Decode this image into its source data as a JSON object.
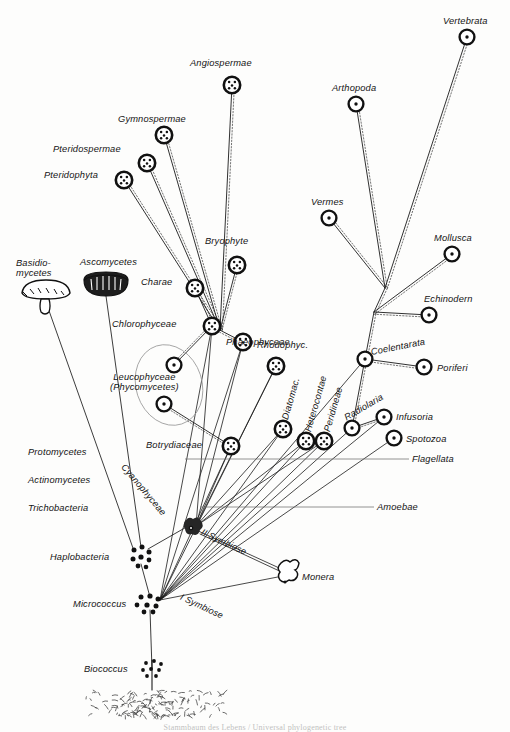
{
  "figure": {
    "caption": "Stammbaum des Lebens / Universal phylogenetic tree",
    "width": 510,
    "height": 732,
    "background_color": "#fdfdfc",
    "ink_color": "#141414"
  },
  "chart_data": {
    "type": "diagram",
    "subtype": "phylogenetic-tree",
    "root": "Biococcus",
    "grid": false,
    "legend": null,
    "xlabel": "",
    "ylabel": "",
    "nodes": [
      {
        "id": "biococcus",
        "label": "Biococcus",
        "x": 152,
        "y": 669,
        "marker": "dot-cluster",
        "label_dx": -62,
        "label_dy": -4
      },
      {
        "id": "micrococcus",
        "label": "Micrococcus",
        "x": 150,
        "y": 604,
        "marker": "dot-cluster",
        "label_dx": -73,
        "label_dy": -3
      },
      {
        "id": "haplobacteria",
        "label": "Haplobacteria",
        "x": 141,
        "y": 557,
        "marker": "dot-cluster",
        "label_dx": -84,
        "label_dy": -3
      },
      {
        "id": "symbiose1",
        "label": "I Symbiose",
        "x": 160,
        "y": 600,
        "marker": "none",
        "label_dx": 0,
        "label_dy": 0
      },
      {
        "id": "symbiose2",
        "label": "II Symbiose",
        "x": 193,
        "y": 528,
        "marker": "dot-small",
        "label_dx": 0,
        "label_dy": 0
      },
      {
        "id": "monera",
        "label": "Monera",
        "x": 288,
        "y": 575,
        "marker": "amoeba",
        "label_dx": 14,
        "label_dy": -4
      },
      {
        "id": "cyanophyceae",
        "label": "Cyanophyceae",
        "x": 193,
        "y": 528,
        "marker": "none",
        "label_dx": 0,
        "label_dy": 0
      },
      {
        "id": "basidiomycetes",
        "label": "Basidio-\nmycetes",
        "x": 46,
        "y": 289,
        "marker": "mushroom",
        "label_dx": -28,
        "label_dy": -34
      },
      {
        "id": "ascomycetes",
        "label": "Ascomycetes",
        "x": 106,
        "y": 284,
        "marker": "cup",
        "label_dx": -22,
        "label_dy": -31
      },
      {
        "id": "protomycetes",
        "label": "Protomycetes",
        "x": 62,
        "y": 452,
        "marker": "none",
        "label_dx": 0,
        "label_dy": 0
      },
      {
        "id": "actinomycetes",
        "label": "Actinomycetes",
        "x": 60,
        "y": 480,
        "marker": "none",
        "label_dx": 0,
        "label_dy": 0
      },
      {
        "id": "trichobacteria",
        "label": "Trichobacteria",
        "x": 62,
        "y": 508,
        "marker": "none",
        "label_dx": 0,
        "label_dy": 0
      },
      {
        "id": "chlorophyceae",
        "label": "Chlorophyceae",
        "x": 212,
        "y": 326,
        "marker": "multi",
        "label_dx": -96,
        "label_dy": -4
      },
      {
        "id": "charae",
        "label": "Charae",
        "x": 195,
        "y": 288,
        "marker": "multi",
        "label_dx": -50,
        "label_dy": -14
      },
      {
        "id": "bryophyte",
        "label": "Bryophyte",
        "x": 237,
        "y": 265,
        "marker": "multi",
        "label_dx": -24,
        "label_dy": -20
      },
      {
        "id": "pteridophyta",
        "label": "Pteridophyta",
        "x": 124,
        "y": 180,
        "marker": "multi",
        "label_dx": -81,
        "label_dy": -12
      },
      {
        "id": "pteridospermae",
        "label": "Pteridospermae",
        "x": 147,
        "y": 163,
        "marker": "multi",
        "label_dx": -95,
        "label_dy": -13
      },
      {
        "id": "gymnospermae",
        "label": "Gymnospermae",
        "x": 164,
        "y": 135,
        "marker": "multi",
        "label_dx": -47,
        "label_dy": -21
      },
      {
        "id": "angiospermae",
        "label": "Angiospermae",
        "x": 232,
        "y": 85,
        "marker": "multi",
        "label_dx": -43,
        "label_dy": -21
      },
      {
        "id": "leucophyceae_a",
        "label": "",
        "x": 174,
        "y": 365,
        "marker": "single",
        "label_dx": 0,
        "label_dy": 0
      },
      {
        "id": "leucophyceae_b",
        "label": "",
        "x": 164,
        "y": 404,
        "marker": "single",
        "label_dx": 0,
        "label_dy": 0
      },
      {
        "id": "leucophyceae",
        "label": "Leucophyceae\n(Phycomycetes)",
        "x": 169,
        "y": 385,
        "marker": "none",
        "label_dx": -58,
        "label_dy": -6
      },
      {
        "id": "botrydiaceae",
        "label": "Botrydiaceae",
        "x": 231,
        "y": 446,
        "marker": "multi",
        "label_dx": -83,
        "label_dy": -4
      },
      {
        "id": "phaeophyceae",
        "label": "Phaeophyceae",
        "x": 243,
        "y": 342,
        "marker": "multi",
        "label_dx": 11,
        "label_dy": -12
      },
      {
        "id": "rhodophyc",
        "label": "Rhodophyc.",
        "x": 276,
        "y": 366,
        "marker": "multi",
        "label_dx": -3,
        "label_dy": -22
      },
      {
        "id": "diatomac",
        "label": "Diatomac.",
        "x": 283,
        "y": 429,
        "marker": "multi",
        "label_dx": 0,
        "label_dy": 0
      },
      {
        "id": "heterocontae",
        "label": "Heterocontae",
        "x": 306,
        "y": 441,
        "marker": "multi",
        "label_dx": 0,
        "label_dy": 0
      },
      {
        "id": "peridineae",
        "label": "Peridineae",
        "x": 324,
        "y": 441,
        "marker": "multi",
        "label_dx": 0,
        "label_dy": 0
      },
      {
        "id": "radiolaria",
        "label": "Radiolaria",
        "x": 352,
        "y": 428,
        "marker": "single",
        "label_dx": 0,
        "label_dy": 0
      },
      {
        "id": "infusoria",
        "label": "Infusoria",
        "x": 384,
        "y": 417,
        "marker": "single",
        "label_dx": 13,
        "label_dy": -4
      },
      {
        "id": "spotozoa",
        "label": "Spotozoa",
        "x": 394,
        "y": 438,
        "marker": "single",
        "label_dx": 13,
        "label_dy": -4
      },
      {
        "id": "flagellata",
        "label": "Flagellata",
        "x": 413,
        "y": 459,
        "marker": "none",
        "label_dx": 0,
        "label_dy": 0
      },
      {
        "id": "amoebae",
        "label": "Amoebae",
        "x": 378,
        "y": 507,
        "marker": "none",
        "label_dx": 0,
        "label_dy": 0
      },
      {
        "id": "coelentarata",
        "label": "Coelentarata",
        "x": 365,
        "y": 359,
        "marker": "single",
        "label_dx": 13,
        "label_dy": -12
      },
      {
        "id": "poriferi",
        "label": "Poriferi",
        "x": 424,
        "y": 367,
        "marker": "single",
        "label_dx": 13,
        "label_dy": -4
      },
      {
        "id": "echinodern",
        "label": "Echinodern",
        "x": 429,
        "y": 315,
        "marker": "single",
        "label_dx": -5,
        "label_dy": -21
      },
      {
        "id": "mollusca",
        "label": "Mollusca",
        "x": 452,
        "y": 254,
        "marker": "single",
        "label_dx": -13,
        "label_dy": -21
      },
      {
        "id": "vermes",
        "label": "Vermes",
        "x": 329,
        "y": 218,
        "marker": "single",
        "label_dx": -18,
        "label_dy": -21
      },
      {
        "id": "arthopoda",
        "label": "Arthopoda",
        "x": 356,
        "y": 104,
        "marker": "single",
        "label_dx": -24,
        "label_dy": -21
      },
      {
        "id": "vertebrata",
        "label": "Vertebrata",
        "x": 467,
        "y": 37,
        "marker": "single",
        "label_dx": -24,
        "label_dy": -21
      }
    ],
    "junctions": [
      {
        "id": "j-plants",
        "x": 220,
        "y": 330
      },
      {
        "id": "j-animals",
        "x": 385,
        "y": 288
      },
      {
        "id": "j-animals2",
        "x": 374,
        "y": 312
      }
    ],
    "reference_lines": [
      {
        "label": "Flagellata",
        "x1": 185,
        "y1": 459,
        "x2": 409,
        "y2": 459
      },
      {
        "label": "Amoebae",
        "x1": 200,
        "y1": 507,
        "x2": 374,
        "y2": 507
      }
    ],
    "edge_style": {
      "solid_stroke": "#1a1a1a",
      "dotted_stroke": "#3a3a3a",
      "solid_width": 0.9,
      "dotted_width": 0.7,
      "dash_pattern": "1.4 1.8"
    }
  },
  "labels": {
    "biococcus": "Biococcus",
    "micrococcus": "Micrococcus",
    "haplobacteria": "Haplobacteria",
    "trichobacteria": "Trichobacteria",
    "actinomycetes": "Actinomycetes",
    "protomycetes": "Protomycetes",
    "symbiose_1": "I Symbiose",
    "symbiose_2": "II Symbiose",
    "cyanophyceae": "Cyanophyceae",
    "monera": "Monera",
    "basidiomycetes": "Basidio-\nmycetes",
    "ascomycetes": "Ascomycetes",
    "leucophyceae": "Leucophyceae\n(Phycomycetes)",
    "chlorophyceae": "Chlorophyceae",
    "charae": "Charae",
    "bryophyte": "Bryophyte",
    "pteridophyta": "Pteridophyta",
    "pteridospermae": "Pteridospermae",
    "gymnospermae": "Gymnospermae",
    "angiospermae": "Angiospermae",
    "botrydiaceae": "Botrydiaceae",
    "phaeophyceae": "Phaeophyceae",
    "rhodophyc": "Rhodophyc.",
    "diatomac": "Diatomac.",
    "heterocontae": "Heterocontae",
    "peridineae": "Peridineae",
    "radiolaria": "Radiolaria",
    "infusoria": "Infusoria",
    "spotozoa": "Spotozoa",
    "flagellata": "Flagellata",
    "amoebae": "Amoebae",
    "coelentarata": "Coelentarata",
    "poriferi": "Poriferi",
    "echinodern": "Echinodern",
    "mollusca": "Mollusca",
    "vermes": "Vermes",
    "arthopoda": "Arthopoda",
    "vertebrata": "Vertebrata"
  }
}
